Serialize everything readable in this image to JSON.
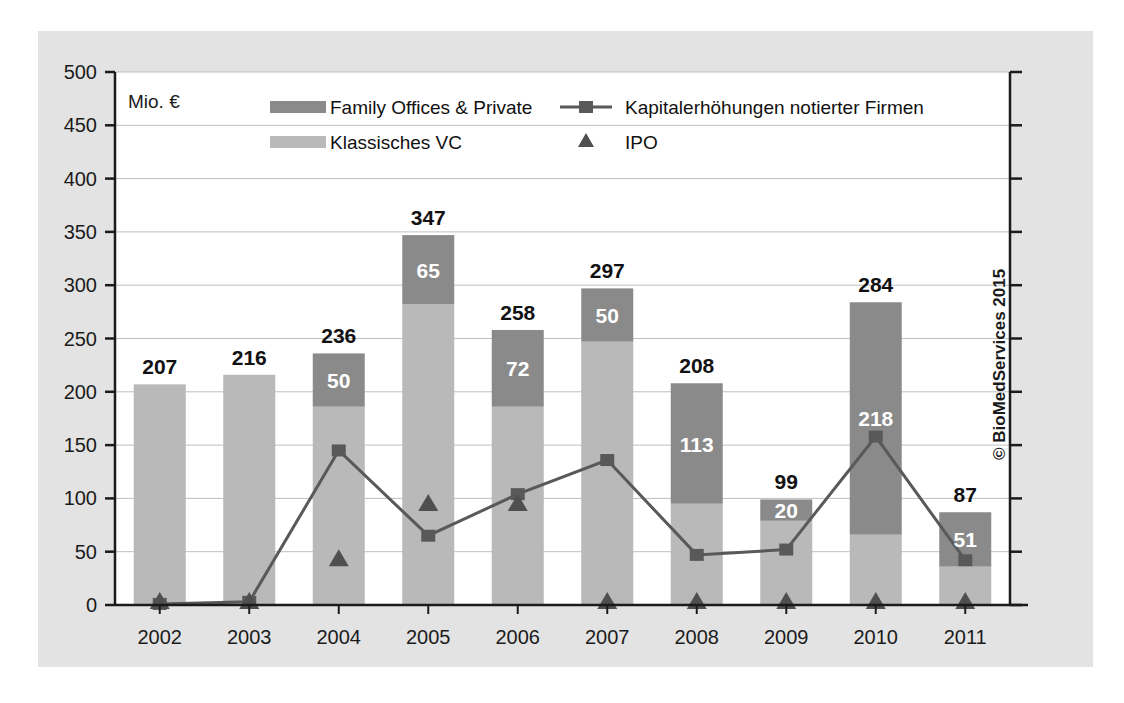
{
  "figure": {
    "unit_label": "Mio. €",
    "copyright": "© BioMedServices 2015",
    "panel_bg": "#e3e3e3",
    "plot_bg": "#ffffff"
  },
  "colors": {
    "family_offices": "#8a8a8a",
    "klassisches_vc": "#b9b9b9",
    "line": "#595959",
    "ipo": "#4f4f4f",
    "axis": "#1b1b1b",
    "grid": "#bfbfbf"
  },
  "legend": {
    "items": [
      {
        "label": "Family Offices & Private",
        "marker": "swatch",
        "color": "#8a8a8a"
      },
      {
        "label": "Klassisches VC",
        "marker": "swatch",
        "color": "#b9b9b9"
      },
      {
        "label": "Kapitalerhöhungen notierter Firmen",
        "marker": "line-square",
        "color": "#595959"
      },
      {
        "label": "IPO",
        "marker": "triangle",
        "color": "#4f4f4f"
      }
    ]
  },
  "chart_data": {
    "type": "bar",
    "title": "",
    "subtitle": "",
    "xlabel": "",
    "ylabel": "Mio. €",
    "ylim": [
      0,
      500
    ],
    "ytick_step": 50,
    "yticks": [
      0,
      50,
      100,
      150,
      200,
      250,
      300,
      350,
      400,
      450,
      500
    ],
    "grid": true,
    "legend_position": "top-inside",
    "stacked": true,
    "categories": [
      "2002",
      "2003",
      "2004",
      "2005",
      "2006",
      "2007",
      "2008",
      "2009",
      "2010",
      "2011"
    ],
    "totals": [
      207,
      216,
      236,
      347,
      258,
      297,
      208,
      99,
      284,
      87
    ],
    "series": [
      {
        "name": "Klassisches VC",
        "type": "bar-stack",
        "color": "#b9b9b9",
        "values": [
          207,
          216,
          186,
          282,
          186,
          247,
          95,
          79,
          66,
          36
        ]
      },
      {
        "name": "Family Offices & Private",
        "type": "bar-stack",
        "color": "#8a8a8a",
        "values": [
          0,
          0,
          50,
          65,
          72,
          50,
          113,
          20,
          218,
          51
        ],
        "labels": [
          "",
          "",
          "50",
          "65",
          "72",
          "50",
          "113",
          "20",
          "218",
          "51"
        ]
      },
      {
        "name": "Kapitalerhöhungen notierter Firmen",
        "type": "line",
        "color": "#595959",
        "values": [
          1,
          3,
          145,
          65,
          104,
          136,
          47,
          52,
          158,
          42
        ]
      },
      {
        "name": "IPO",
        "type": "scatter",
        "color": "#4f4f4f",
        "values": [
          0,
          0,
          40,
          92,
          92,
          0,
          0,
          0,
          0,
          0
        ]
      }
    ]
  }
}
